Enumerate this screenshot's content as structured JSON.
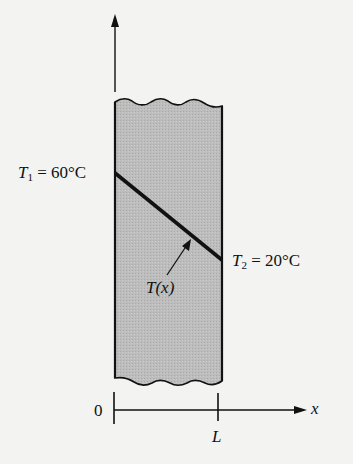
{
  "diagram": {
    "type": "plane-wall-temperature-profile",
    "labels": {
      "t1_symbol": "T",
      "t1_subscript": "1",
      "t1_value": " = 60°C",
      "t2_symbol": "T",
      "t2_subscript": "2",
      "t2_value": " = 20°C",
      "profile_label": "T(x)",
      "origin_label": "0",
      "length_label": "L",
      "axis_label": "x"
    },
    "colors": {
      "wall_fill": "#b9b9b9",
      "line": "#111111",
      "background": "#f3f3f1"
    },
    "profile": {
      "x": [
        0,
        1
      ],
      "T": [
        60,
        20
      ],
      "unit": "°C",
      "shape": "linear"
    }
  }
}
